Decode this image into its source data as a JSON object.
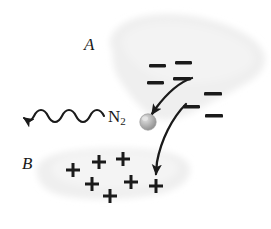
{
  "figure": {
    "type": "scientific-diagram",
    "width": 271,
    "height": 229,
    "background_color": "#ffffff",
    "ink_color": "#1a1a1a",
    "cloud_color": "#f0f0f0"
  },
  "labels": {
    "region_a": "A",
    "region_b": "B",
    "molecule": "N",
    "molecule_subscript": "2"
  },
  "regions": [
    {
      "name": "region-a-cloud",
      "label": "A",
      "charge": "negative",
      "fill": "#f0f0f0",
      "path": "M 112 48 C 108 36 120 22 140 18 C 160 13 186 14 208 20 C 232 26 254 36 262 50 C 268 62 262 74 248 82 C 234 90 214 100 196 110 C 180 118 166 122 154 116 C 142 110 130 96 120 80 C 113 68 114 56 112 48 Z"
    },
    {
      "name": "region-b-cloud",
      "label": "B",
      "charge": "positive",
      "fill": "#f0f0f0",
      "path": "M 38 172 C 36 162 48 155 70 152 C 96 149 130 149 158 152 C 178 154 190 160 190 170 C 190 182 178 190 156 194 C 128 199 92 200 66 196 C 46 193 39 182 38 172 Z"
    }
  ],
  "charges": {
    "negative_symbol": "−",
    "positive_symbol": "+",
    "negative_count": 8,
    "positive_count": 6,
    "negative_positions": [
      {
        "x": 158,
        "y": 68
      },
      {
        "x": 184,
        "y": 65
      },
      {
        "x": 156,
        "y": 84
      },
      {
        "x": 182,
        "y": 80
      },
      {
        "x": 192,
        "y": 108
      },
      {
        "x": 212,
        "y": 95
      },
      {
        "x": 214,
        "y": 116
      },
      {
        "x": 178,
        "y": 98
      }
    ],
    "positive_positions": [
      {
        "x": 73,
        "y": 170
      },
      {
        "x": 99,
        "y": 162
      },
      {
        "x": 123,
        "y": 160
      },
      {
        "x": 92,
        "y": 184
      },
      {
        "x": 131,
        "y": 183
      },
      {
        "x": 110,
        "y": 196
      },
      {
        "x": 155,
        "y": 186
      }
    ]
  },
  "arrows": [
    {
      "name": "wavy-emission-arrow",
      "style": "wavy",
      "direction": "left",
      "from": {
        "x": 104,
        "y": 118
      },
      "to": {
        "x": 18,
        "y": 118
      }
    },
    {
      "name": "incoming-electron-arrow",
      "style": "curved",
      "direction": "down-left",
      "from": {
        "x": 186,
        "y": 78
      },
      "to": {
        "x": 150,
        "y": 116
      }
    },
    {
      "name": "outgoing-charge-arrow",
      "style": "curved",
      "direction": "down",
      "from": {
        "x": 190,
        "y": 108
      },
      "to": {
        "x": 157,
        "y": 180
      }
    }
  ],
  "particle": {
    "name": "nitrogen-molecule-sphere",
    "cx": 148,
    "cy": 122,
    "r": 8,
    "fill": "#a8a8a8",
    "highlight": "#e0e0e0"
  }
}
